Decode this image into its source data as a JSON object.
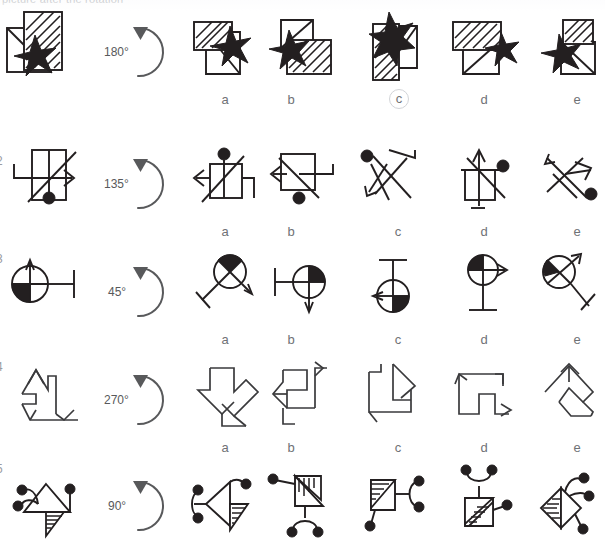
{
  "header": {
    "cutoff_text": "picture after the rotation"
  },
  "test": {
    "title": "Mental Rotation Test",
    "option_letters": [
      "a",
      "b",
      "c",
      "d",
      "e"
    ],
    "degree_symbol": "°"
  },
  "rows": [
    {
      "number": "1",
      "number_visible": false,
      "rotation": "180°",
      "rotation_degrees": 180,
      "stimulus_name": "star-over-hatched-rectangle",
      "selected_option": "c",
      "options": [
        "a",
        "b",
        "c",
        "d",
        "e"
      ]
    },
    {
      "number": "2",
      "number_visible": true,
      "rotation": "135°",
      "rotation_degrees": 135,
      "stimulus_name": "arrow-lines-with-dot",
      "selected_option": null,
      "options": [
        "a",
        "b",
        "c",
        "d",
        "e"
      ]
    },
    {
      "number": "3",
      "number_visible": true,
      "rotation": "45°",
      "rotation_degrees": 45,
      "stimulus_name": "quartered-circle-with-bar",
      "selected_option": null,
      "options": [
        "a",
        "b",
        "c",
        "d",
        "e"
      ]
    },
    {
      "number": "4",
      "number_visible": true,
      "rotation": "270°",
      "rotation_degrees": 270,
      "stimulus_name": "double-arrow-zigzag",
      "selected_option": null,
      "options": [
        "a",
        "b",
        "c",
        "d",
        "e"
      ]
    },
    {
      "number": "5",
      "number_visible": true,
      "rotation": "90°",
      "rotation_degrees": 90,
      "stimulus_name": "hatched-triangle-with-dots",
      "selected_option": null,
      "options": [
        "a",
        "b",
        "c",
        "d",
        "e"
      ]
    }
  ],
  "colors": {
    "ink": "#231f20",
    "line": "#3a3a3c",
    "rotation_gray": "#58595b",
    "label_gray": "#6f7276",
    "circle_marker": "#d2d4d8",
    "background": "#ffffff"
  }
}
